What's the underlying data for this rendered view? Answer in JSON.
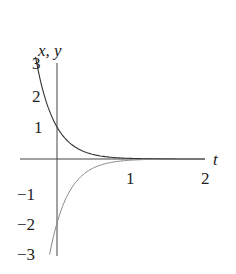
{
  "chart_data": {
    "type": "line",
    "title": "",
    "xlabel": "t",
    "ylabel": "x, y",
    "xlim": [
      -0.45,
      2
    ],
    "ylim": [
      -3,
      3
    ],
    "x_ticks": [
      "1",
      "2"
    ],
    "y_ticks": [
      "3",
      "2",
      "1",
      "−1",
      "−2",
      "−3"
    ],
    "grid": false,
    "legend": null,
    "series": [
      {
        "name": "x(t)",
        "formula": "e^(-4t)",
        "style": "solid dark",
        "x": [
          -0.27,
          -0.2,
          -0.1,
          0,
          0.1,
          0.25,
          0.5,
          0.75,
          1,
          1.5,
          2
        ],
        "values": [
          3.0,
          2.23,
          1.49,
          1.0,
          0.67,
          0.37,
          0.14,
          0.05,
          0.02,
          0.0,
          0.0
        ]
      },
      {
        "name": "y(t)",
        "formula": "-2e^(-4t)",
        "style": "solid gray",
        "x": [
          -0.1,
          0,
          0.1,
          0.25,
          0.5,
          0.75,
          1,
          1.5,
          2
        ],
        "values": [
          -2.98,
          -2.0,
          -1.34,
          -0.74,
          -0.27,
          -0.1,
          -0.04,
          0.0,
          0.0
        ]
      }
    ]
  },
  "labels": {
    "ylabel": "x, y",
    "xlabel": "t",
    "yt3": "3",
    "yt2": "2",
    "yt1": "1",
    "ytm1": "−1",
    "ytm2": "−2",
    "ytm3": "−3",
    "xt1": "1",
    "xt2": "2"
  }
}
